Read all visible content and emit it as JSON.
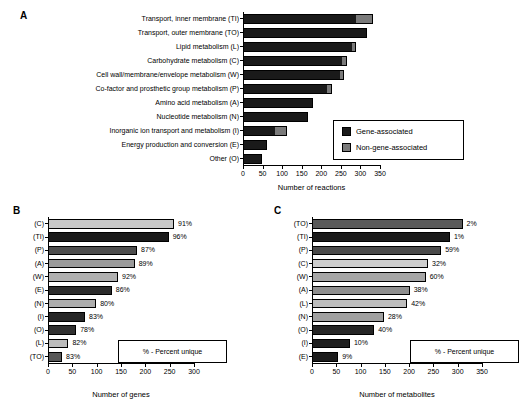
{
  "figure": {
    "panels": [
      {
        "letter": "A"
      },
      {
        "letter": "B"
      },
      {
        "letter": "C"
      }
    ]
  },
  "panelA": {
    "letter": "A",
    "xlabel": "Number of reactions",
    "ticks": [
      "0",
      "50",
      "100",
      "150",
      "200",
      "250",
      "300",
      "350"
    ],
    "legend": {
      "gene_label": "Gene-associated",
      "nongene_label": "Non-gene-associated",
      "gene_color": "#1a1a1a",
      "nongene_color": "#7a7a7a"
    },
    "rows": [
      {
        "label": "Transport, inner membrane (TI)",
        "gene": 288,
        "nongene": 43
      },
      {
        "label": "Transport, outer membrane (TO)",
        "gene": 313,
        "nongene": 5
      },
      {
        "label": "Lipid metabolism (L)",
        "gene": 278,
        "nongene": 10
      },
      {
        "label": "Carbohydrate metabolism (C)",
        "gene": 253,
        "nongene": 12
      },
      {
        "label": "Cell wall/membrane/envelope metabolism (W)",
        "gene": 247,
        "nongene": 12
      },
      {
        "label": "Co-factor and prosthetic group metabolism (P)",
        "gene": 215,
        "nongene": 13
      },
      {
        "label": "Amino acid metabolism (A)",
        "gene": 178,
        "nongene": 0
      },
      {
        "label": "Nucleotide metabolism (N)",
        "gene": 165,
        "nongene": 0
      },
      {
        "label": "Inorganic ion transport and metabolism (I)",
        "gene": 82,
        "nongene": 30
      },
      {
        "label": "Energy production and conversion (E)",
        "gene": 61,
        "nongene": 0
      },
      {
        "label": "Other (O)",
        "gene": 48,
        "nongene": 0
      }
    ]
  },
  "panelB": {
    "letter": "B",
    "xlabel": "Number of genes",
    "ticks": [
      "0",
      "50",
      "100",
      "150",
      "200",
      "250",
      "300"
    ],
    "note": "% - Percent unique",
    "rows": [
      {
        "label": "(C)",
        "value": 259,
        "percent": "91%",
        "color": "#c8c8c8"
      },
      {
        "label": "(TI)",
        "value": 248,
        "percent": "96%",
        "color": "#1a1a1a"
      },
      {
        "label": "(P)",
        "value": 183,
        "percent": "87%",
        "color": "#4d4d4d"
      },
      {
        "label": "(A)",
        "value": 178,
        "percent": "89%",
        "color": "#9a9a9a"
      },
      {
        "label": "(W)",
        "value": 144,
        "percent": "92%",
        "color": "#b0b0b0"
      },
      {
        "label": "(E)",
        "value": 131,
        "percent": "86%",
        "color": "#2b2b2b"
      },
      {
        "label": "(N)",
        "value": 99,
        "percent": "80%",
        "color": "#adadad"
      },
      {
        "label": "(I)",
        "value": 76,
        "percent": "83%",
        "color": "#262626"
      },
      {
        "label": "(O)",
        "value": 58,
        "percent": "78%",
        "color": "#303030"
      },
      {
        "label": "(L)",
        "value": 42,
        "percent": "82%",
        "color": "#bcbcbc"
      },
      {
        "label": "(TO)",
        "value": 29,
        "percent": "83%",
        "color": "#575757"
      }
    ]
  },
  "panelC": {
    "letter": "C",
    "xlabel": "Number of metabolites",
    "ticks": [
      "0",
      "50",
      "100",
      "150",
      "200",
      "250",
      "300",
      "350"
    ],
    "note": "% - Percent unique",
    "rows": [
      {
        "label": "(TO)",
        "value": 310,
        "percent": "2%",
        "color": "#5a5a5a"
      },
      {
        "label": "(TI)",
        "value": 284,
        "percent": "1%",
        "color": "#1a1a1a"
      },
      {
        "label": "(P)",
        "value": 266,
        "percent": "59%",
        "color": "#4a4a4a"
      },
      {
        "label": "(C)",
        "value": 239,
        "percent": "32%",
        "color": "#cfcfcf"
      },
      {
        "label": "(W)",
        "value": 234,
        "percent": "60%",
        "color": "#a6a6a6"
      },
      {
        "label": "(A)",
        "value": 201,
        "percent": "38%",
        "color": "#8f8f8f"
      },
      {
        "label": "(L)",
        "value": 196,
        "percent": "42%",
        "color": "#bdbdbd"
      },
      {
        "label": "(N)",
        "value": 148,
        "percent": "28%",
        "color": "#a0a0a0"
      },
      {
        "label": "(O)",
        "value": 128,
        "percent": "40%",
        "color": "#262626"
      },
      {
        "label": "(I)",
        "value": 78,
        "percent": "10%",
        "color": "#1f1f1f"
      },
      {
        "label": "(E)",
        "value": 54,
        "percent": "9%",
        "color": "#1c1c1c"
      }
    ]
  },
  "chart_data": [
    {
      "type": "bar",
      "orientation": "horizontal",
      "stacked": true,
      "panel": "A",
      "title": "",
      "xlabel": "Number of reactions",
      "ylabel": "",
      "xlim": [
        0,
        350
      ],
      "xticks": [
        0,
        50,
        100,
        150,
        200,
        250,
        300,
        350
      ],
      "grid": false,
      "legend_position": "inside-right-lower",
      "categories": [
        "Transport, inner membrane (TI)",
        "Transport, outer membrane (TO)",
        "Lipid metabolism (L)",
        "Carbohydrate metabolism (C)",
        "Cell wall/membrane/envelope metabolism (W)",
        "Co-factor and prosthetic group metabolism (P)",
        "Amino acid metabolism (A)",
        "Nucleotide metabolism (N)",
        "Inorganic ion transport and metabolism (I)",
        "Energy production and conversion (E)",
        "Other (O)"
      ],
      "series": [
        {
          "name": "Gene-associated",
          "values": [
            288,
            313,
            278,
            253,
            247,
            215,
            178,
            165,
            82,
            61,
            48
          ]
        },
        {
          "name": "Non-gene-associated",
          "values": [
            43,
            5,
            10,
            12,
            12,
            13,
            0,
            0,
            30,
            0,
            0
          ]
        }
      ],
      "totals": [
        331,
        318,
        288,
        265,
        259,
        228,
        178,
        165,
        112,
        61,
        48
      ]
    },
    {
      "type": "bar",
      "orientation": "horizontal",
      "stacked": false,
      "panel": "B",
      "title": "",
      "xlabel": "Number of genes",
      "ylabel": "",
      "xlim": [
        0,
        300
      ],
      "xticks": [
        0,
        50,
        100,
        150,
        200,
        250,
        300
      ],
      "grid": false,
      "annotation": "% - Percent unique",
      "categories": [
        "(C)",
        "(TI)",
        "(P)",
        "(A)",
        "(W)",
        "(E)",
        "(N)",
        "(I)",
        "(O)",
        "(L)",
        "(TO)"
      ],
      "values": [
        259,
        248,
        183,
        178,
        144,
        131,
        99,
        76,
        58,
        42,
        29
      ],
      "data_labels": [
        "91%",
        "96%",
        "87%",
        "89%",
        "92%",
        "86%",
        "80%",
        "83%",
        "78%",
        "82%",
        "83%"
      ]
    },
    {
      "type": "bar",
      "orientation": "horizontal",
      "stacked": false,
      "panel": "C",
      "title": "",
      "xlabel": "Number of metabolites",
      "ylabel": "",
      "xlim": [
        0,
        350
      ],
      "xticks": [
        0,
        50,
        100,
        150,
        200,
        250,
        300,
        350
      ],
      "grid": false,
      "annotation": "% - Percent unique",
      "categories": [
        "(TO)",
        "(TI)",
        "(P)",
        "(C)",
        "(W)",
        "(A)",
        "(L)",
        "(N)",
        "(O)",
        "(I)",
        "(E)"
      ],
      "values": [
        310,
        284,
        266,
        239,
        234,
        201,
        196,
        148,
        128,
        78,
        54
      ],
      "data_labels": [
        "2%",
        "1%",
        "59%",
        "32%",
        "60%",
        "38%",
        "42%",
        "28%",
        "40%",
        "10%",
        "9%"
      ]
    }
  ]
}
